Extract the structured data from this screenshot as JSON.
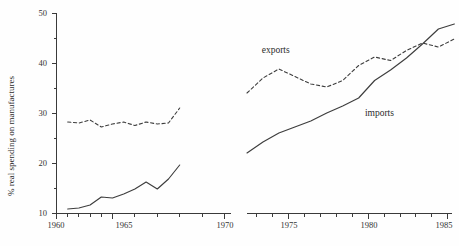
{
  "chart_data": {
    "type": "line",
    "title": "",
    "subtitle": "",
    "xlabel": "",
    "ylabel": "% real spending on manufactures",
    "xlim": [
      1960,
      1985
    ],
    "ylim": [
      10,
      50
    ],
    "grid": false,
    "legend_position": "inline-annotation",
    "axis_break": {
      "after": 1971,
      "before": 1972,
      "note": "horizontal axis is broken between 1971 and 1972"
    },
    "x_major_ticks": [
      1960,
      1965,
      1970,
      1975,
      1980,
      1985
    ],
    "x_major_tick_labels": [
      "1960",
      "1965",
      "1970",
      "1975",
      "1980",
      "1985"
    ],
    "x_minor_tick_interval": 1,
    "y_major_ticks": [
      10,
      20,
      30,
      40,
      50
    ],
    "y_major_tick_labels": [
      "10",
      "20",
      "30",
      "40",
      "50"
    ],
    "y_minor_ticks": [
      15,
      25,
      35,
      45
    ],
    "annotations": [
      {
        "text": "exports",
        "x": 1973.8,
        "y": 42.0
      },
      {
        "text": "imports",
        "x": 1980.3,
        "y": 29.5
      }
    ],
    "series": [
      {
        "name": "exports",
        "style": "dashed",
        "segments": [
          {
            "x": [
              1961,
              1962,
              1963,
              1964,
              1965,
              1966,
              1967,
              1968,
              1969,
              1970,
              1971
            ],
            "values": [
              28.2,
              28.0,
              28.6,
              27.2,
              27.8,
              28.2,
              27.5,
              28.2,
              27.8,
              28.0,
              31.0
            ]
          },
          {
            "x": [
              1972,
              1973,
              1974,
              1975,
              1976,
              1977,
              1978,
              1979,
              1980,
              1981,
              1982,
              1983,
              1984,
              1985
            ],
            "values": [
              34.0,
              37.0,
              38.8,
              37.3,
              35.8,
              35.2,
              36.5,
              39.5,
              41.2,
              40.5,
              42.5,
              44.0,
              43.2,
              44.8
            ]
          }
        ]
      },
      {
        "name": "imports",
        "style": "solid",
        "segments": [
          {
            "x": [
              1961,
              1962,
              1963,
              1964,
              1965,
              1966,
              1967,
              1968,
              1969,
              1970,
              1971
            ],
            "values": [
              10.8,
              11.0,
              11.6,
              13.2,
              13.0,
              13.8,
              14.8,
              16.2,
              14.8,
              16.8,
              19.6
            ]
          },
          {
            "x": [
              1972,
              1973,
              1974,
              1975,
              1976,
              1977,
              1978,
              1979,
              1980,
              1981,
              1982,
              1983,
              1984,
              1985
            ],
            "values": [
              22.0,
              24.2,
              26.0,
              27.2,
              28.4,
              30.0,
              31.4,
              33.0,
              36.5,
              38.6,
              41.0,
              43.8,
              46.8,
              47.8
            ]
          }
        ]
      }
    ]
  },
  "axis": {
    "ylabel": "% real spending on manufactures",
    "y_labels": [
      "50",
      "40",
      "30",
      "20",
      "10"
    ],
    "x_labels": [
      "1960",
      "1965",
      "1970",
      "1975",
      "1980",
      "1985"
    ]
  },
  "labels": {
    "exports": "exports",
    "imports": "imports"
  }
}
